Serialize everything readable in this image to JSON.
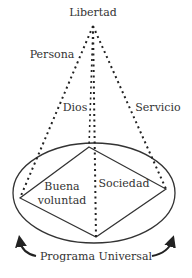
{
  "diagram": {
    "apex_label": "Libertad",
    "edge_labels": {
      "left": "Persona",
      "center": "Dios",
      "right": "Servicio"
    },
    "regions": {
      "left_line1": "Buena",
      "left_line2": "voluntad",
      "right": "Sociedad"
    },
    "base_label": "Programa Universal",
    "colors": {
      "stroke": "#333333",
      "background": "#ffffff"
    }
  }
}
